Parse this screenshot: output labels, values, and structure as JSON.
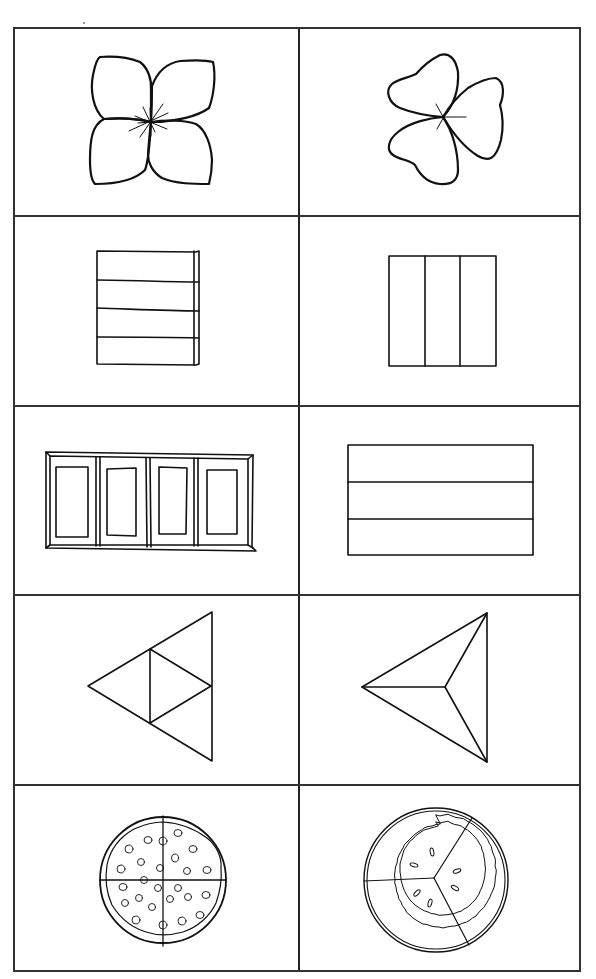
{
  "worksheet": {
    "layout": {
      "rows": 5,
      "columns": 2
    },
    "cells": [
      {
        "row": 1,
        "col": 1,
        "shape": "four-petal-flower",
        "parts": 4
      },
      {
        "row": 1,
        "col": 2,
        "shape": "three-leaf-clover",
        "parts": 3
      },
      {
        "row": 2,
        "col": 1,
        "shape": "square-horizontal-stripes",
        "parts": 4
      },
      {
        "row": 2,
        "col": 2,
        "shape": "square-vertical-thirds",
        "parts": 3
      },
      {
        "row": 3,
        "col": 1,
        "shape": "four-pane-window",
        "parts": 4
      },
      {
        "row": 3,
        "col": 2,
        "shape": "rectangle-horizontal-thirds",
        "parts": 3
      },
      {
        "row": 4,
        "col": 1,
        "shape": "triangle-four-subtriangles",
        "parts": 4
      },
      {
        "row": 4,
        "col": 2,
        "shape": "triangle-three-from-center",
        "parts": 3
      },
      {
        "row": 5,
        "col": 1,
        "shape": "pizza-quartered",
        "parts": 4
      },
      {
        "row": 5,
        "col": 2,
        "shape": "pie-three-slices",
        "parts": 3
      }
    ],
    "colors": {
      "ink": "#111111",
      "border": "#333333",
      "background": "#ffffff"
    }
  }
}
